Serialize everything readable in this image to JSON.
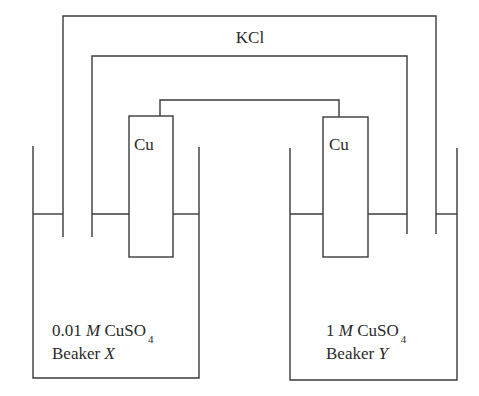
{
  "diagram": {
    "type": "galvanic concentration cell",
    "salt_bridge": {
      "label": "KCl"
    },
    "electrodes": [
      {
        "id": "left",
        "label": "Cu"
      },
      {
        "id": "right",
        "label": "Cu"
      }
    ],
    "beakers": [
      {
        "id": "X",
        "conc_value": "0.01",
        "conc_unit": "M",
        "solute": "CuSO",
        "subscript": "4",
        "name_prefix": "Beaker",
        "name_letter": "X"
      },
      {
        "id": "Y",
        "conc_value": "1",
        "conc_unit": "M",
        "solute": "CuSO",
        "subscript": "4",
        "name_prefix": "Beaker",
        "name_letter": "Y"
      }
    ],
    "colors": {
      "line": "#3a3a3a",
      "text": "#2a2a2a",
      "background": "#ffffff"
    }
  }
}
